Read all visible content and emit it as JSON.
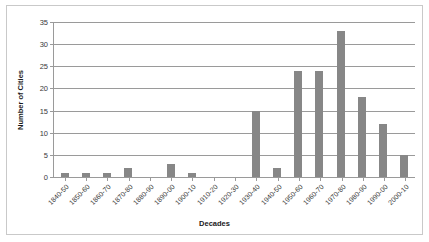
{
  "chart_data": {
    "type": "bar",
    "title": "",
    "xlabel": "Decades",
    "ylabel": "Number of Cities",
    "categories": [
      "1840-50",
      "1850-60",
      "1860-70",
      "1870-80",
      "1880-90",
      "1890-00",
      "1900-10",
      "1910-20",
      "1920-30",
      "1930-40",
      "1940-50",
      "1950-60",
      "1960-70",
      "1970-80",
      "1980-90",
      "1990-00",
      "2000-10"
    ],
    "values": [
      1,
      1,
      1,
      2,
      0,
      3,
      1,
      0,
      0,
      15,
      2,
      24,
      24,
      33,
      18,
      12,
      5
    ],
    "ylim": [
      0,
      35
    ],
    "yticks": [
      0,
      5,
      10,
      15,
      20,
      25,
      30,
      35
    ],
    "ytick_labels": [
      "0",
      "5",
      "10",
      "15",
      "20",
      "25",
      "30",
      "35"
    ],
    "grid": "horizontal",
    "legend": "none",
    "bar_color": "#878787",
    "gridline_color": "#9a9a9a",
    "background_color": "#ffffff",
    "border_color": "#c9c9c9",
    "x_label_rotation_deg": -45
  }
}
